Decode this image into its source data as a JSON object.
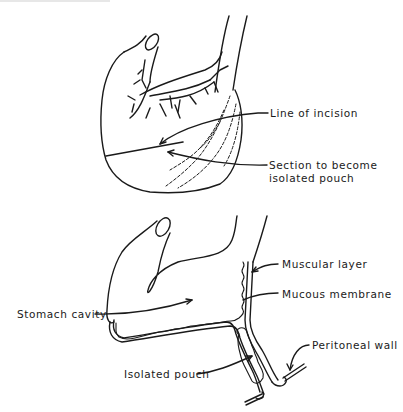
{
  "figure": {
    "top_diagram": {
      "labels": {
        "line_of_incision": "Line of incision",
        "section_line1": "Section to become",
        "section_line2": "isolated pouch"
      }
    },
    "bottom_diagram": {
      "labels": {
        "muscular_layer": "Muscular layer",
        "mucous_membrane": "Mucous membrane",
        "stomach_cavity": "Stomach cavity",
        "peritoneal_wall": "Peritoneal wall",
        "isolated_pouch": "Isolated pouch"
      }
    },
    "colors": {
      "ink": "#1a1a1a",
      "background": "#ffffff"
    }
  }
}
